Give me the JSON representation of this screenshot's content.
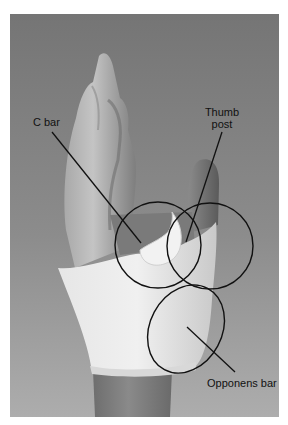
{
  "figure": {
    "background_top": "#767676",
    "background_bottom": "#ababab",
    "page_background": "#ffffff",
    "annotation_color": "#111111"
  },
  "annotations": [
    {
      "id": "c-bar",
      "label_lines": [
        "C bar"
      ]
    },
    {
      "id": "thumb-post",
      "label_lines": [
        "Thumb",
        "post"
      ]
    },
    {
      "id": "opponens-bar",
      "label_lines": [
        "Opponens bar"
      ]
    }
  ]
}
